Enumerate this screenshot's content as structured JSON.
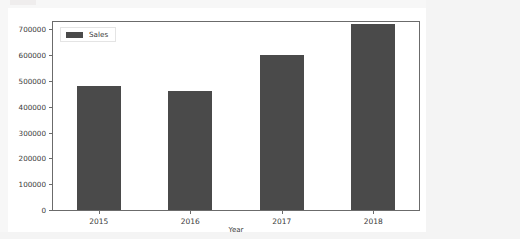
{
  "chart_data": {
    "type": "bar",
    "title": "",
    "subtitle": "",
    "xlabel": "Year",
    "ylabel": "",
    "categories": [
      "2015",
      "2016",
      "2017",
      "2018"
    ],
    "values": [
      480000,
      460000,
      600000,
      720000
    ],
    "series": [
      {
        "name": "Sales",
        "values": [
          480000,
          460000,
          600000,
          720000
        ],
        "color": "#4a4a4a"
      }
    ],
    "ylim": [
      0,
      728000
    ],
    "yticks": [
      0,
      100000,
      200000,
      300000,
      400000,
      500000,
      600000,
      700000
    ],
    "ytick_labels": [
      "0",
      "100000",
      "200000",
      "300000",
      "400000",
      "500000",
      "600000",
      "700000"
    ],
    "xtick_labels": [
      "2015",
      "2016",
      "2017",
      "2018"
    ],
    "grid": false,
    "legend": {
      "position": "upper-left",
      "entries": [
        {
          "label": "Sales",
          "color": "#4a4a4a"
        }
      ]
    }
  },
  "colors": {
    "bar": "#4a4a4a",
    "axis": "#6b6b6b",
    "text": "#3a3a3a",
    "figure_background": "#ffffff",
    "page_background": "#f4f4f4"
  }
}
